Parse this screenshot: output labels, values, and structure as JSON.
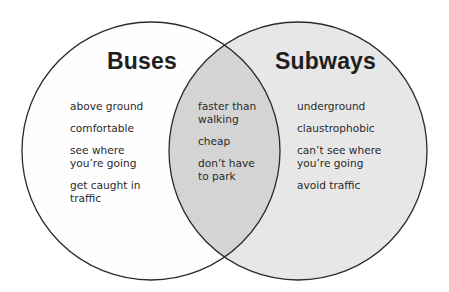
{
  "diagram": {
    "type": "venn",
    "colors": {
      "outline": "#2a2a2a",
      "left_fill": "#fefefe",
      "right_fill": "#e7e7e7",
      "overlap_fill": "#d4d4d4"
    },
    "left": {
      "title": "Buses",
      "items": [
        "above ground",
        "comfortable",
        "see where you’re going",
        "get caught in traffic"
      ]
    },
    "overlap": {
      "items": [
        "faster than walking",
        "cheap",
        "don’t have to park"
      ]
    },
    "right": {
      "title": "Subways",
      "items": [
        "underground",
        "claustrophobic",
        "can’t see where you’re going",
        "avoid traffic"
      ]
    }
  }
}
